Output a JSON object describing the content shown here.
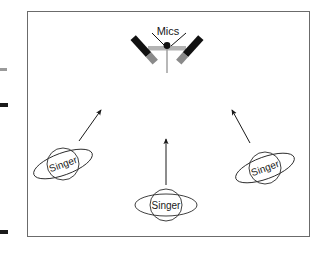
{
  "figure": {
    "kind": "stage-setup-diagram",
    "background_color": "#ffffff",
    "frame": {
      "border_color": "#6b6b6b",
      "border_width": 1,
      "x": 27,
      "y": 11,
      "width": 283,
      "height": 226
    },
    "edge_marks": [
      {
        "name": "left-tick-upper",
        "x": 0,
        "y": 68,
        "width": 7,
        "height": 3,
        "color": "#7a7a7a"
      },
      {
        "name": "left-tick-middle",
        "x": 0,
        "y": 103,
        "width": 8,
        "height": 4,
        "color": "#1a1a1a"
      },
      {
        "name": "left-tick-lower",
        "x": 0,
        "y": 230,
        "width": 8,
        "height": 4,
        "color": "#1a1a1a"
      }
    ]
  },
  "mics": {
    "label": "Mics",
    "label_x": 168,
    "label_y": 30,
    "body_color": "#111111",
    "tip_color": "#8a8a8a",
    "bar_color": "#b0b0b0",
    "apex_dot_color": "#111111",
    "stand_color": "#9a9a9a",
    "leader_line_color": "#111111"
  },
  "singers": [
    {
      "name": "singer-left",
      "label": "Singer",
      "cx": 63,
      "cy": 164,
      "r": 16,
      "ring_rx": 31,
      "ring_ry": 11,
      "rotation": -20,
      "stroke": "#2a2a2a",
      "fill": "#ffffff",
      "font_size": 10
    },
    {
      "name": "singer-center",
      "label": "Singer",
      "cx": 166,
      "cy": 205,
      "r": 16,
      "ring_rx": 31,
      "ring_ry": 11,
      "rotation": 0,
      "stroke": "#2a2a2a",
      "fill": "#ffffff",
      "font_size": 10
    },
    {
      "name": "singer-right",
      "label": "Singer",
      "cx": 265,
      "cy": 168,
      "r": 16,
      "ring_rx": 31,
      "ring_ry": 11,
      "rotation": -20,
      "stroke": "#2a2a2a",
      "fill": "#ffffff",
      "font_size": 10
    }
  ],
  "arrows": [
    {
      "name": "arrow-left-singer-to-mics",
      "x1": 79,
      "y1": 141,
      "x2": 101,
      "y2": 110,
      "color": "#1a1a1a"
    },
    {
      "name": "arrow-center-singer-to-mics",
      "x1": 166,
      "y1": 185,
      "x2": 166,
      "y2": 139,
      "color": "#1a1a1a"
    },
    {
      "name": "arrow-right-singer-to-mics",
      "x1": 250,
      "y1": 143,
      "x2": 232,
      "y2": 110,
      "color": "#1a1a1a"
    }
  ]
}
